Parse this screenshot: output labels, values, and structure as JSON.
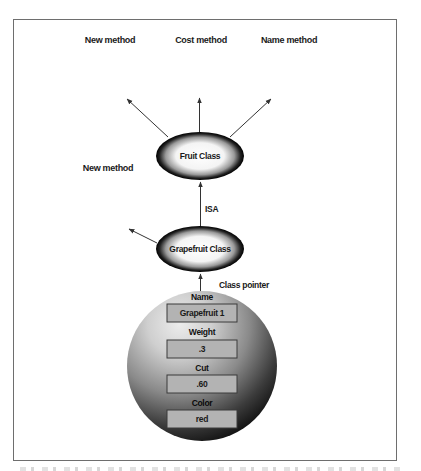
{
  "diagram": {
    "top_labels": {
      "new_method": "New method",
      "cost_method": "Cost method",
      "name_method": "Name method"
    },
    "side_label_new_method": "New method",
    "fruit_class": "Fruit Class",
    "isa_label": "ISA",
    "grapefruit_class": "Grapefruit Class",
    "class_pointer_label": "Class pointer",
    "instance": {
      "fields": [
        {
          "label": "Name",
          "value": "Grapefruit 1"
        },
        {
          "label": "Weight",
          "value": ".3"
        },
        {
          "label": "Cut",
          "value": ".60"
        },
        {
          "label": "Color",
          "value": "red"
        }
      ]
    },
    "colors": {
      "frame_border": "#6e6e6e",
      "field_box_fill": "#b3b3b3",
      "field_box_border": "#3a3a3a",
      "arrow": "#333333",
      "text": "#1a1a1a"
    }
  }
}
